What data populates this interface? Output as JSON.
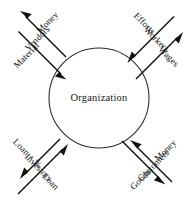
{
  "diagram": {
    "center": {
      "label": "Organization",
      "shape": "circle"
    },
    "quadrants": [
      {
        "id": "vendors",
        "position": "top-left",
        "stakeholder": "Vendors",
        "outflow": "Money",
        "inflow": "Material"
      },
      {
        "id": "workers",
        "position": "top-right",
        "stakeholder": "Workers",
        "outflow": "Wages",
        "inflow": "Efforts"
      },
      {
        "id": "investors",
        "position": "bottom-left",
        "stakeholder": "Investors",
        "outflow": "Loan + %",
        "inflow": "Loan"
      },
      {
        "id": "customers",
        "position": "bottom-right",
        "stakeholder": "Customers",
        "outflow": "Goods",
        "inflow": "Money"
      }
    ],
    "colors": {
      "stroke": "#111111",
      "circle": "#2a2a2a",
      "text": "#101010",
      "background": "#ffffff"
    }
  }
}
